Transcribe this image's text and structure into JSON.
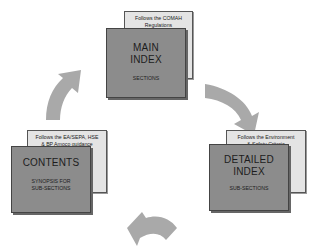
{
  "diagram": {
    "type": "cycle",
    "colors": {
      "front_card": "#8c8c8c",
      "back_card": "#e4e4e4",
      "arrow": "#a9a9a9",
      "border": "#444444"
    },
    "nodes": [
      {
        "id": "main-index",
        "title_line1": "MAIN",
        "title_line2": "INDEX",
        "subtitle": "SECTIONS",
        "note_line1": "Follows the COMAH",
        "note_line2": "Regulations"
      },
      {
        "id": "detailed-index",
        "title_line1": "DETAILED",
        "title_line2": "INDEX",
        "subtitle": "SUB-SECTIONS",
        "note_line1": "Follows the Environment",
        "note_line2": "& Safety Criteria"
      },
      {
        "id": "contents",
        "title_line1": "CONTENTS",
        "subtitle_line1": "SYNOPSIS FOR",
        "subtitle_line2": "SUB-SECTIONS",
        "note_line1": "Follows the EA/SEPA, HSE",
        "note_line2": "& BP Amoco guidance"
      }
    ],
    "arrows": [
      {
        "from": "main-index",
        "to": "detailed-index",
        "icon": "curved-arrow-icon"
      },
      {
        "from": "detailed-index",
        "to": "contents",
        "icon": "curved-arrow-icon"
      },
      {
        "from": "contents",
        "to": "main-index",
        "icon": "curved-arrow-icon"
      }
    ]
  }
}
